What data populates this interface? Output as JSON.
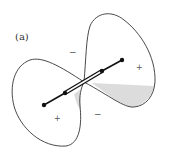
{
  "figure": {
    "panel_label": "(a)",
    "signs": [
      {
        "id": "minus-top",
        "symbol": "−",
        "x": 72,
        "y": 55
      },
      {
        "id": "minus-bottom",
        "symbol": "−",
        "x": 97,
        "y": 117
      },
      {
        "id": "plus-right",
        "symbol": "+",
        "x": 139,
        "y": 70
      },
      {
        "id": "plus-left",
        "symbol": "+",
        "x": 57,
        "y": 121
      }
    ],
    "colors": {
      "outline": "#4a4a4a",
      "rod": "#111111",
      "shading": "#d9d9d9",
      "background": "#ffffff"
    }
  }
}
